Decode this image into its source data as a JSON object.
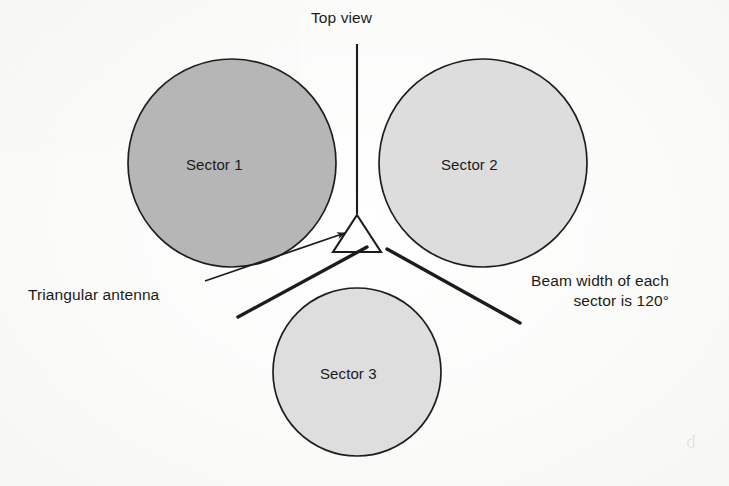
{
  "figure": {
    "kind": "antenna-sector-coverage-diagram",
    "top_view_label": "Top view",
    "antenna_label": "Triangular antenna",
    "beam_label_line1": "Beam width of each",
    "beam_label_line2": "sector is 120°",
    "sectors": [
      {
        "label": "Sector 1",
        "fill": "#b6b6b6",
        "cx": 232,
        "cy": 163,
        "r": 104
      },
      {
        "label": "Sector 2",
        "fill": "#dddddd",
        "cx": 483,
        "cy": 163,
        "r": 104
      },
      {
        "label": "Sector 3",
        "fill": "#dedede",
        "cx": 357,
        "cy": 372,
        "r": 84
      }
    ],
    "colors": {
      "sector1_fill": "#b6b6b6",
      "sector2_fill": "#dddddd",
      "sector3_fill": "#dedede",
      "outline": "#1f1f1f",
      "text": "#1b1b1b",
      "paper": "#fbfbfa"
    },
    "ghost_text": [
      "prova hear of the massive Tower receivers, of a",
      "are separated by a minimum multipath phase. A or the",
      "for a    with a sector linear amplification, base station   are",
      "are the capacity of the system and the filtering, Superi",
      "to be necessary with the number of antenna. Furthermore,",
      "are beamforming effect which has been increased. Sector",
      "are mobiles of a system which is within good link",
      "as the case of a sector number as its antenna rou",
      "a considerable to the handlers and receivers l",
      "and multiple Base stations which have brought distr",
      "the sectors subjects. Beam for sectors  on the m",
      "by one diversional antenna in to the small C",
      "a    multiplexed by      require th",
      "b"
    ]
  }
}
